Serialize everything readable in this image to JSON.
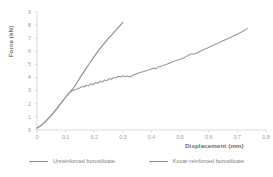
{
  "chart_data": {
    "type": "line",
    "title": "",
    "xlabel": "Displacement (mm)",
    "ylabel": "Force (kN)",
    "xlim": [
      0,
      0.8
    ],
    "ylim": [
      0,
      9
    ],
    "xticks": [
      "0",
      "0.1",
      "0.2",
      "0.3",
      "0.4",
      "0.5",
      "0.6",
      "0.7",
      "0.8"
    ],
    "yticks": [
      "0",
      "1",
      "2",
      "3",
      "4",
      "5",
      "6",
      "7",
      "8",
      "9"
    ],
    "grid": false,
    "legend_position": "bottom",
    "series": [
      {
        "name": "Unreinforced borosilicate",
        "color": "#8a8a8a",
        "points": [
          [
            0.0,
            0.15
          ],
          [
            0.01,
            0.28
          ],
          [
            0.02,
            0.45
          ],
          [
            0.03,
            0.65
          ],
          [
            0.04,
            0.88
          ],
          [
            0.05,
            1.12
          ],
          [
            0.06,
            1.38
          ],
          [
            0.07,
            1.65
          ],
          [
            0.08,
            1.93
          ],
          [
            0.09,
            2.22
          ],
          [
            0.1,
            2.5
          ],
          [
            0.11,
            2.78
          ],
          [
            0.12,
            3.02
          ],
          [
            0.13,
            3.28
          ],
          [
            0.14,
            3.62
          ],
          [
            0.15,
            3.98
          ],
          [
            0.16,
            4.32
          ],
          [
            0.17,
            4.66
          ],
          [
            0.18,
            4.98
          ],
          [
            0.19,
            5.3
          ],
          [
            0.2,
            5.62
          ],
          [
            0.21,
            5.92
          ],
          [
            0.22,
            6.2
          ],
          [
            0.23,
            6.48
          ],
          [
            0.24,
            6.74
          ],
          [
            0.25,
            7.0
          ],
          [
            0.26,
            7.24
          ],
          [
            0.27,
            7.48
          ],
          [
            0.28,
            7.72
          ],
          [
            0.29,
            7.96
          ],
          [
            0.3,
            8.2
          ]
        ]
      },
      {
        "name": "Kovar-reinforced borosilicate",
        "color": "#9a9a9a",
        "points": [
          [
            0.0,
            0.15
          ],
          [
            0.01,
            0.28
          ],
          [
            0.02,
            0.45
          ],
          [
            0.03,
            0.65
          ],
          [
            0.04,
            0.88
          ],
          [
            0.05,
            1.12
          ],
          [
            0.06,
            1.38
          ],
          [
            0.07,
            1.65
          ],
          [
            0.08,
            1.93
          ],
          [
            0.09,
            2.22
          ],
          [
            0.1,
            2.5
          ],
          [
            0.11,
            2.76
          ],
          [
            0.12,
            2.96
          ],
          [
            0.13,
            3.05
          ],
          [
            0.14,
            3.12
          ],
          [
            0.15,
            3.22
          ],
          [
            0.16,
            3.34
          ],
          [
            0.165,
            3.28
          ],
          [
            0.172,
            3.42
          ],
          [
            0.18,
            3.36
          ],
          [
            0.188,
            3.52
          ],
          [
            0.196,
            3.46
          ],
          [
            0.204,
            3.62
          ],
          [
            0.212,
            3.56
          ],
          [
            0.22,
            3.72
          ],
          [
            0.228,
            3.66
          ],
          [
            0.236,
            3.82
          ],
          [
            0.244,
            3.76
          ],
          [
            0.252,
            3.92
          ],
          [
            0.26,
            3.86
          ],
          [
            0.268,
            4.02
          ],
          [
            0.276,
            3.96
          ],
          [
            0.284,
            4.1
          ],
          [
            0.292,
            4.04
          ],
          [
            0.3,
            4.14
          ],
          [
            0.308,
            4.06
          ],
          [
            0.316,
            4.12
          ],
          [
            0.324,
            4.05
          ],
          [
            0.332,
            4.14
          ],
          [
            0.34,
            4.22
          ],
          [
            0.35,
            4.3
          ],
          [
            0.36,
            4.38
          ],
          [
            0.37,
            4.44
          ],
          [
            0.38,
            4.52
          ],
          [
            0.39,
            4.58
          ],
          [
            0.4,
            4.66
          ],
          [
            0.41,
            4.72
          ],
          [
            0.415,
            4.66
          ],
          [
            0.425,
            4.8
          ],
          [
            0.435,
            4.88
          ],
          [
            0.445,
            4.96
          ],
          [
            0.455,
            5.04
          ],
          [
            0.465,
            5.12
          ],
          [
            0.475,
            5.2
          ],
          [
            0.485,
            5.28
          ],
          [
            0.495,
            5.36
          ],
          [
            0.505,
            5.44
          ],
          [
            0.515,
            5.52
          ],
          [
            0.52,
            5.6
          ],
          [
            0.528,
            5.68
          ],
          [
            0.534,
            5.76
          ],
          [
            0.54,
            5.82
          ],
          [
            0.548,
            5.78
          ],
          [
            0.556,
            5.86
          ],
          [
            0.566,
            5.96
          ],
          [
            0.576,
            6.06
          ],
          [
            0.586,
            6.16
          ],
          [
            0.596,
            6.26
          ],
          [
            0.606,
            6.36
          ],
          [
            0.616,
            6.46
          ],
          [
            0.626,
            6.56
          ],
          [
            0.636,
            6.66
          ],
          [
            0.646,
            6.76
          ],
          [
            0.656,
            6.86
          ],
          [
            0.666,
            6.96
          ],
          [
            0.676,
            7.06
          ],
          [
            0.686,
            7.16
          ],
          [
            0.696,
            7.26
          ],
          [
            0.706,
            7.38
          ],
          [
            0.716,
            7.5
          ],
          [
            0.726,
            7.62
          ],
          [
            0.735,
            7.75
          ]
        ]
      }
    ]
  },
  "legend": {
    "entries": [
      {
        "label": "Unreinforced borosilicate"
      },
      {
        "label": "Kovar-reinforced borosilicate"
      }
    ]
  }
}
